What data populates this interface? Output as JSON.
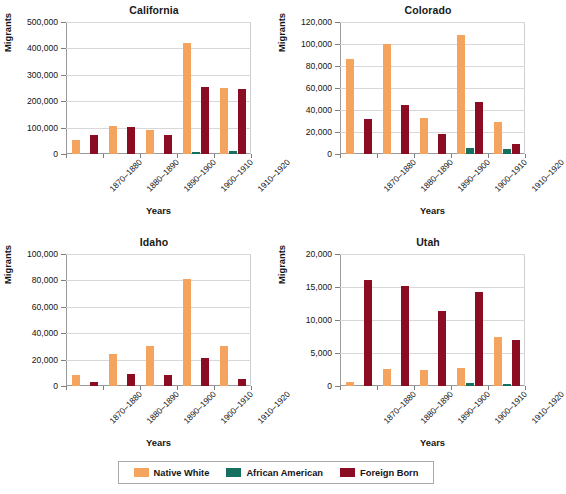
{
  "chart_data": {
    "type": "bar",
    "title": "",
    "categories": [
      "1870–1880",
      "1880–1890",
      "1890–1900",
      "1900–1910",
      "1910–1920"
    ],
    "legend": {
      "position": "bottom",
      "entries": [
        {
          "name": "Native White",
          "color": "#f4a45f"
        },
        {
          "name": "African American",
          "color": "#16705f"
        },
        {
          "name": "Foreign Born",
          "color": "#8a0d23"
        }
      ]
    },
    "xlabel": "Years",
    "ylabel": "Migrants",
    "grid": true,
    "panels": [
      {
        "title": "California",
        "ylim": [
          0,
          500000
        ],
        "yticks": [
          0,
          100000,
          200000,
          300000,
          400000,
          500000
        ],
        "yticklabels": [
          "0",
          "100,000",
          "200,000",
          "300,000",
          "400,000",
          "500,000"
        ],
        "series": [
          {
            "name": "Native White",
            "values": [
              53000,
              105000,
              92000,
              420000,
              251000
            ]
          },
          {
            "name": "African American",
            "values": [
              0,
              0,
              0,
              6000,
              12000
            ]
          },
          {
            "name": "Foreign Born",
            "values": [
              71000,
              101000,
              71000,
              254000,
              245000
            ]
          }
        ]
      },
      {
        "title": "Colorado",
        "ylim": [
          0,
          120000
        ],
        "yticks": [
          0,
          20000,
          40000,
          60000,
          80000,
          100000,
          120000
        ],
        "yticklabels": [
          "0",
          "20,000",
          "40,000",
          "60,000",
          "80,000",
          "100,000",
          "120,000"
        ],
        "series": [
          {
            "name": "Native White",
            "values": [
              86000,
              100000,
              33000,
              108000,
              29000
            ]
          },
          {
            "name": "African American",
            "values": [
              0,
              0,
              0,
              5500,
              5000
            ]
          },
          {
            "name": "Foreign Born",
            "values": [
              32000,
              45000,
              18000,
              47000,
              9000
            ]
          }
        ]
      },
      {
        "title": "Idaho",
        "ylim": [
          0,
          100000
        ],
        "yticks": [
          0,
          20000,
          40000,
          60000,
          80000,
          100000
        ],
        "yticklabels": [
          "0",
          "20,000",
          "40,000",
          "60,000",
          "80,000",
          "100,000"
        ],
        "series": [
          {
            "name": "Native White",
            "values": [
              8500,
              24000,
              30500,
              81000,
              30500
            ]
          },
          {
            "name": "African American",
            "values": [
              0,
              0,
              0,
              0,
              0
            ]
          },
          {
            "name": "Foreign Born",
            "values": [
              3000,
              9000,
              8500,
              21000,
              5000
            ]
          }
        ]
      },
      {
        "title": "Utah",
        "ylim": [
          0,
          20000
        ],
        "yticks": [
          0,
          5000,
          10000,
          15000,
          20000
        ],
        "yticklabels": [
          "0",
          "5,000",
          "10,000",
          "15,000",
          "20,000"
        ],
        "series": [
          {
            "name": "Native White",
            "values": [
              600,
              2600,
              2400,
              2750,
              7500
            ]
          },
          {
            "name": "African American",
            "values": [
              0,
              0,
              0,
              400,
              350
            ]
          },
          {
            "name": "Foreign Born",
            "values": [
              16100,
              15100,
              11300,
              14300,
              7000
            ]
          }
        ]
      }
    ]
  }
}
